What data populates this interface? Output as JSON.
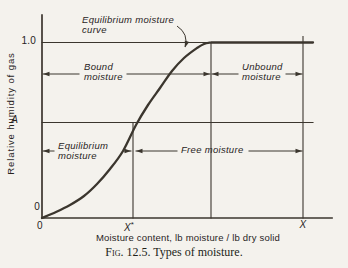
{
  "figure": {
    "caption_smallcaps": "Fig.",
    "caption_rest": " 12.5. Types of moisture."
  },
  "chart_data": {
    "type": "line",
    "title": "",
    "xlabel": "Moisture content, lb moisture / lb dry solid",
    "ylabel": "Relative humidity of gas",
    "curve_annotation": {
      "line1": "Equilibrium moisture",
      "line2": "curve"
    },
    "y_tick_labels": {
      "saturation": "1.0",
      "a_level": "A",
      "zero": "0"
    },
    "x_tick_labels": {
      "zero": "0",
      "xstar_base": "X",
      "xstar_sup": "*",
      "x_total": "X"
    },
    "region_labels": {
      "bound": {
        "line1": "Bound",
        "line2": "moisture"
      },
      "unbound": {
        "line1": "Unbound",
        "line2": "moisture"
      },
      "equilibrium": {
        "line1": "Equilibrium",
        "line2": "moisture"
      },
      "free": {
        "line1": "Free moisture"
      }
    },
    "series": [
      {
        "name": "Equilibrium moisture curve",
        "description_visible": "S-shaped curve from origin (0,0) rising to relative humidity 1.0 at the critical moisture content, flat at 1.0 out to X; crosses humidity level A at moisture content X*"
      }
    ],
    "axis_ranges": {
      "y": [
        "0",
        "A",
        "1.0"
      ],
      "x": [
        "0",
        "X*",
        "X"
      ]
    },
    "colors": {
      "paper": "#f4f2ed",
      "ink_line": "#3b362e",
      "ink_text": "#28241d"
    },
    "geometry": {
      "axis": {
        "x": 42,
        "y": 218,
        "top": 15,
        "right": 332
      },
      "h_lines": [
        {
          "name": "saturation-line",
          "y": 42.5,
          "x1": 42,
          "x2": 313
        },
        {
          "name": "humidity-a-line",
          "y": 122.5,
          "x1": 42,
          "x2": 313
        }
      ],
      "v_lines": [
        {
          "name": "xstar-line",
          "x": 133,
          "y1": 122.5,
          "y2": 218
        },
        {
          "name": "critical-moisture-line",
          "x": 211,
          "y1": 42.5,
          "y2": 218
        },
        {
          "name": "x-total-line",
          "x": 303,
          "y1": 36.5,
          "y2": 218
        }
      ],
      "curve_points": [
        [
          42,
          218
        ],
        [
          56,
          212
        ],
        [
          70,
          205
        ],
        [
          84,
          196
        ],
        [
          97,
          184
        ],
        [
          110,
          169
        ],
        [
          123,
          151
        ],
        [
          136,
          125
        ],
        [
          148,
          105
        ],
        [
          160,
          88
        ],
        [
          172,
          71
        ],
        [
          184,
          58
        ],
        [
          197,
          48
        ],
        [
          204,
          44
        ],
        [
          211,
          42.5
        ]
      ],
      "curve_end": [
        313,
        42.5
      ],
      "span_arrows": [
        {
          "name": "bound-moisture-arrow",
          "y": 74,
          "segs": [
            [
              43,
              79
            ],
            [
              127,
              210
            ]
          ],
          "heads": [
            [
              43,
              180
            ],
            [
              210,
              0
            ]
          ]
        },
        {
          "name": "unbound-moisture-arrow",
          "y": 74,
          "segs": [
            [
              212,
              238
            ],
            [
              286,
              302
            ]
          ],
          "heads": [
            [
              212,
              180
            ],
            [
              302,
              0
            ]
          ]
        },
        {
          "name": "equilibrium-moisture-arrow",
          "y": 151,
          "segs": [
            [
              43,
              54
            ],
            [
              124,
              131
            ]
          ],
          "heads": [
            [
              43,
              180
            ],
            [
              131,
              0
            ]
          ]
        },
        {
          "name": "free-moisture-arrow",
          "y": 151,
          "segs": [
            [
              136,
              177
            ],
            [
              249,
              302
            ]
          ],
          "heads": [
            [
              136,
              180
            ],
            [
              302,
              0
            ]
          ]
        }
      ],
      "annotation_arrow": {
        "path": "M177,26 Q189,34 185,47",
        "tip": [
          185,
          47.5
        ],
        "angle": 108
      }
    }
  }
}
